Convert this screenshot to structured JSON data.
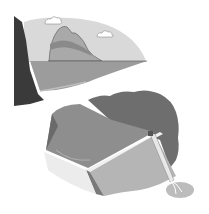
{
  "figure": {
    "panels": [
      {
        "name": "natural-lake",
        "elements": [
          "cliff",
          "sky",
          "clouds",
          "mountain",
          "lake"
        ]
      },
      {
        "name": "dam-reservoir",
        "elements": [
          "hills",
          "reservoir",
          "dam-wall",
          "spillway",
          "outflow-splash"
        ]
      }
    ],
    "colors": {
      "sky": "#d9d9d9",
      "cliff": "#3a3a3a",
      "mountain": "#a9a9a9",
      "mountain_band": "#8a8a8a",
      "lake": "#9c9c9c",
      "hills": "#6e6e6e",
      "reservoir": "#8e8e8e",
      "dam_face": "#b5b5b5",
      "dam_side": "#7a7a7a",
      "cloud": "#ffffff"
    }
  }
}
